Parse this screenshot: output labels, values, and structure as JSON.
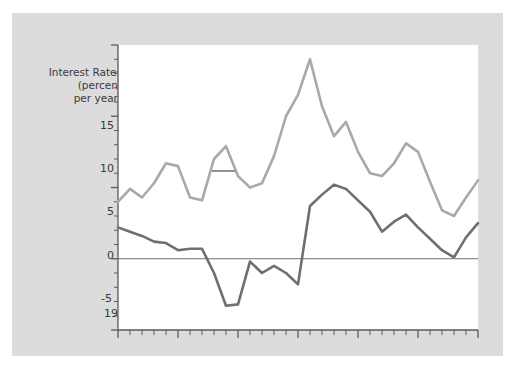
{
  "chart_data": {
    "type": "line",
    "title": "",
    "xlabel": "",
    "ylabel": "Interest Rates\n(percent\nper year)",
    "xlim": [
      1965,
      1995
    ],
    "ylim": [
      -5,
      15
    ],
    "grid": false,
    "legend_position": "inline-annotation",
    "zero_line": 0,
    "y_ticks_major": [
      -5,
      0,
      5,
      10,
      15
    ],
    "y_ticks_minor_step": 1,
    "x_ticks_major": [
      1965,
      1970,
      1975,
      1980,
      1985,
      1990,
      1995
    ],
    "x_ticks_minor_step": 1,
    "x": [
      1965,
      1966,
      1967,
      1968,
      1969,
      1970,
      1971,
      1972,
      1973,
      1974,
      1975,
      1976,
      1977,
      1978,
      1979,
      1980,
      1981,
      1982,
      1983,
      1984,
      1985,
      1986,
      1987,
      1988,
      1989,
      1990,
      1991,
      1992,
      1993,
      1994,
      1995
    ],
    "series": [
      {
        "name": "Nominal interest rate",
        "color": "#a9a9a9",
        "values": [
          4.0,
          4.9,
          4.3,
          5.3,
          6.7,
          6.5,
          4.3,
          4.1,
          7.0,
          7.9,
          5.8,
          5.0,
          5.3,
          7.2,
          10.0,
          11.5,
          14.0,
          10.7,
          8.6,
          9.6,
          7.5,
          6.0,
          5.8,
          6.7,
          8.1,
          7.5,
          5.4,
          3.4,
          3.0,
          4.3,
          5.5
        ]
      },
      {
        "name": "Real interest rate",
        "color": "#6f6f6f",
        "values": [
          2.2,
          1.9,
          1.6,
          1.2,
          1.1,
          0.6,
          0.7,
          0.7,
          -1.0,
          -3.3,
          -3.2,
          -0.2,
          -1.0,
          -0.5,
          -1.0,
          -1.8,
          3.7,
          4.5,
          5.2,
          4.9,
          4.1,
          3.3,
          1.9,
          2.6,
          3.1,
          2.2,
          1.4,
          0.6,
          0.1,
          1.5,
          2.5
        ]
      }
    ],
    "annotations": [
      {
        "text": "Nominal interest rate",
        "anchor_year": 1973,
        "anchor_value": 9.8
      },
      {
        "text": "Real interest rate",
        "anchor_year": 1980,
        "anchor_value": -3.5
      }
    ]
  },
  "axis": {
    "y_title_line1": "Interest Rates",
    "y_title_line2": "(percent",
    "y_title_line3": "per year)",
    "y_labels": [
      "15",
      "10",
      "5",
      "0",
      "-5"
    ],
    "x_labels": [
      "1965",
      "1970",
      "1975",
      "1980",
      "1985",
      "1990",
      "1995"
    ]
  },
  "colors": {
    "page_background": "#ffffff",
    "frame_background": "#dcdcdc",
    "plot_background": "#ffffff",
    "axis": "#5a5a5a",
    "text": "#3a3a3a",
    "nominal_line": "#a9a9a9",
    "real_line": "#6f6f6f",
    "zero_line": "#6f6f6f"
  }
}
